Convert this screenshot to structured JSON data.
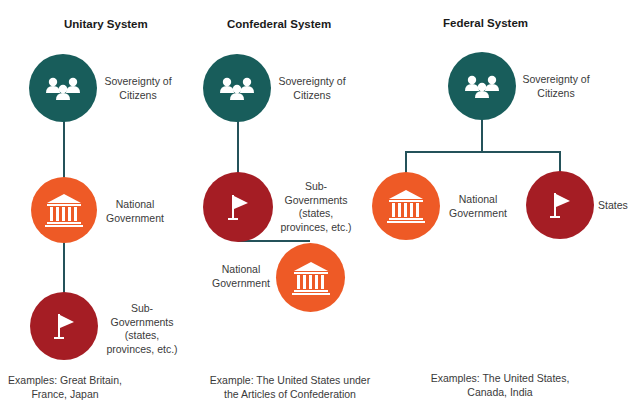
{
  "columns": [
    {
      "title": "Unitary System",
      "nodes": [
        {
          "type": "citizens",
          "label": "Sovereignty of Citizens",
          "label_lines": [
            "Sovereignty of",
            "Citizens"
          ],
          "color": "#185d5b"
        },
        {
          "type": "national",
          "label": "National Government",
          "label_lines": [
            "National",
            "Government"
          ],
          "color": "#ee5a26"
        },
        {
          "type": "sub",
          "label": "Sub-Governments (states, provinces, etc.)",
          "label_lines": [
            "Sub-",
            "Governments",
            "(states,",
            "provinces, etc.)"
          ],
          "color": "#a51d24"
        }
      ],
      "example_lines": [
        "Examples: Great Britain,",
        "France, Japan"
      ]
    },
    {
      "title": "Confederal System",
      "nodes": [
        {
          "type": "citizens",
          "label": "Sovereignty of Citizens",
          "label_lines": [
            "Sovereignty of",
            "Citizens"
          ],
          "color": "#185d5b"
        },
        {
          "type": "sub",
          "label": "Sub-Governments (states, provinces, etc.)",
          "label_lines": [
            "Sub-",
            "Governments",
            "(states,",
            "provinces, etc.)"
          ],
          "color": "#a51d24"
        },
        {
          "type": "national",
          "label": "National Government",
          "label_lines": [
            "National",
            "Government"
          ],
          "color": "#ee5a26"
        }
      ],
      "example_lines": [
        "Example: The United States under",
        "the Articles of Confederation"
      ]
    },
    {
      "title": "Federal System",
      "nodes": [
        {
          "type": "citizens",
          "label": "Sovereignty of Citizens",
          "label_lines": [
            "Sovereignty of",
            "Citizens"
          ],
          "color": "#185d5b"
        },
        {
          "type": "national",
          "label": "National Government",
          "label_lines": [
            "National",
            "Government"
          ],
          "color": "#ee5a26"
        },
        {
          "type": "states",
          "label": "States",
          "label_lines": [
            "States"
          ],
          "color": "#a51d24"
        }
      ],
      "example_lines": [
        "Examples: The United States,",
        "Canada, India"
      ]
    }
  ],
  "icons": {
    "citizens": "people-group-icon",
    "national": "capitol-building-icon",
    "sub": "flag-icon"
  },
  "colors": {
    "teal": "#185d5b",
    "orange": "#ee5a26",
    "red": "#a51d24",
    "connector": "#24525a"
  }
}
